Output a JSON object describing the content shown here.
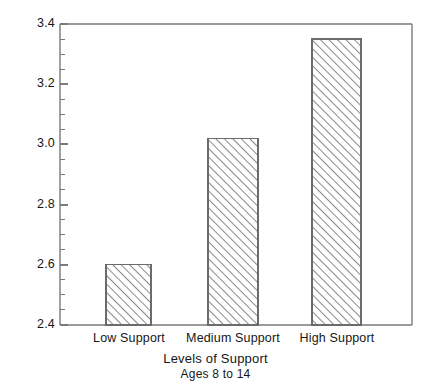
{
  "chart_data": {
    "type": "bar",
    "title": "",
    "subtitle": "",
    "categories": [
      "Low Support",
      "Medium Support",
      "High Support"
    ],
    "values": [
      2.6,
      3.02,
      3.35
    ],
    "xlabel": "Levels of Support",
    "xlabel_sub": "Ages 8 to 14",
    "ylabel": "Self-Esteem Score",
    "ylim": [
      2.4,
      3.4
    ],
    "ytick_labels": [
      "2.4",
      "2.6",
      "2.8",
      "3.0",
      "3.2",
      "3.4"
    ],
    "ytick_values": [
      2.4,
      2.6,
      2.8,
      3.0,
      3.2,
      3.4
    ],
    "ytick_minor_step": 0.05,
    "grid": false,
    "legend": null,
    "bar_fill": "#ffffff",
    "bar_edge_color": "#6b6b6b",
    "bar_hatch": "diagonal-45",
    "axis_color": "#7a7a7a",
    "text_color": "#161616",
    "background": "#ffffff"
  },
  "axes": {
    "frame_left": 60,
    "frame_right": 412,
    "frame_top": 24,
    "frame_bottom": 325
  },
  "bars": [
    {
      "label": "Low Support",
      "value": 2.6,
      "x_left": 106,
      "x_right": 151,
      "y_top": 265
    },
    {
      "label": "Medium Support",
      "value": 3.02,
      "x_left": 208,
      "x_right": 258,
      "y_top": 138
    },
    {
      "label": "High Support",
      "value": 3.35,
      "x_left": 312,
      "x_right": 361,
      "y_top": 39
    }
  ]
}
